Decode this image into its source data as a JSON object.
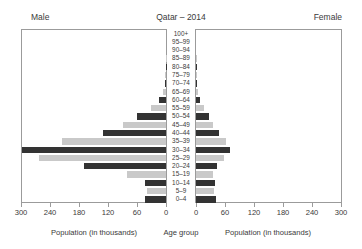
{
  "header": {
    "left_label": "Male",
    "title": "Qatar – 2014",
    "right_label": "Female"
  },
  "axis": {
    "left_caption": "Population (in thousands)",
    "center_caption": "Age group",
    "right_caption": "Population (in thousands)",
    "left_ticks": [
      "300",
      "240",
      "180",
      "120",
      "60",
      "0"
    ],
    "right_ticks": [
      "0",
      "60",
      "120",
      "180",
      "240",
      "300"
    ]
  },
  "colors": {
    "bar_dark": "#333333",
    "bar_light": "#c9c9c9",
    "frame": "#9b9b9b",
    "text": "#3a3a3a",
    "background": "#ffffff"
  },
  "chart_data": {
    "type": "bar",
    "title": "Qatar – 2014",
    "subtype": "population-pyramid",
    "xlabel": "Population (in thousands)",
    "ylabel": "Age group",
    "xlim": [
      0,
      300
    ],
    "grid": false,
    "legend": false,
    "units": "thousands",
    "categories": [
      "100+",
      "95–99",
      "90–94",
      "85–89",
      "80–84",
      "75–79",
      "70–74",
      "65–69",
      "60–64",
      "55–59",
      "50–54",
      "45–49",
      "40–44",
      "35–39",
      "30–34",
      "25–29",
      "20–24",
      "15–19",
      "10–14",
      "5–9",
      "0–4"
    ],
    "series": [
      {
        "name": "Male",
        "side": "left",
        "values": [
          0,
          0,
          0,
          0.5,
          1,
          2,
          3,
          6,
          14,
          32,
          60,
          88,
          130,
          215,
          298,
          263,
          170,
          80,
          44,
          40,
          44
        ]
      },
      {
        "name": "Female",
        "side": "right",
        "values": [
          0,
          0,
          0,
          0.4,
          0.8,
          1.4,
          2,
          4,
          8,
          16,
          26,
          36,
          48,
          62,
          70,
          58,
          44,
          36,
          40,
          38,
          42
        ]
      }
    ],
    "shading": [
      "dark",
      "light",
      "dark",
      "light",
      "dark",
      "light",
      "dark",
      "light",
      "dark",
      "light",
      "dark",
      "light",
      "dark",
      "light",
      "dark",
      "light",
      "dark",
      "light",
      "dark",
      "light",
      "dark"
    ]
  }
}
